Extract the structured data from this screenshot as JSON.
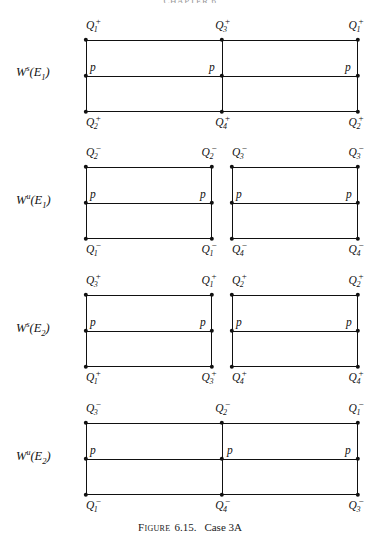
{
  "figure": {
    "caption_label": "Figure",
    "caption_number": "6.15.",
    "caption_title": "Case 3A",
    "header_remnant": "CHAPTER 6"
  },
  "rows": [
    {
      "name": "ws-e1",
      "label_w": "W",
      "label_sup": "s",
      "label_open": "(E",
      "label_sub": "1",
      "label_close": ")",
      "top_labels": [
        {
          "q": "Q",
          "sub": "1",
          "sup": "+"
        },
        {
          "q": "Q",
          "sub": "3",
          "sup": "+"
        },
        {
          "q": "Q",
          "sub": "1",
          "sup": "+"
        }
      ],
      "bottom_labels": [
        {
          "q": "Q",
          "sub": "2",
          "sup": "+"
        },
        {
          "q": "Q",
          "sub": "4",
          "sup": "+"
        },
        {
          "q": "Q",
          "sub": "2",
          "sup": "+"
        }
      ],
      "p_markers": [
        "p",
        "p",
        "p"
      ]
    },
    {
      "name": "wu-e1",
      "label_w": "W",
      "label_sup": "u",
      "label_open": "(E",
      "label_sub": "1",
      "label_close": ")",
      "left_box": {
        "top_left": {
          "q": "Q",
          "sub": "2",
          "sup": "−"
        },
        "top_right": {
          "q": "Q",
          "sub": "2",
          "sup": "−"
        },
        "bottom_left": {
          "q": "Q",
          "sub": "1",
          "sup": "−"
        },
        "bottom_right": {
          "q": "Q",
          "sub": "1",
          "sup": "−"
        },
        "p_left": "p",
        "p_right": "p"
      },
      "right_box": {
        "top_left": {
          "q": "Q",
          "sub": "3",
          "sup": "−"
        },
        "top_right": {
          "q": "Q",
          "sub": "3",
          "sup": "−"
        },
        "bottom_left": {
          "q": "Q",
          "sub": "4",
          "sup": "−"
        },
        "bottom_right": {
          "q": "Q",
          "sub": "4",
          "sup": "−"
        },
        "p_left": "p",
        "p_right": "p"
      }
    },
    {
      "name": "ws-e2",
      "label_w": "W",
      "label_sup": "s",
      "label_open": "(E",
      "label_sub": "2",
      "label_close": ")",
      "left_box": {
        "top_left": {
          "q": "Q",
          "sub": "3",
          "sup": "+"
        },
        "top_right": {
          "q": "Q",
          "sub": "1",
          "sup": "+"
        },
        "bottom_left": {
          "q": "Q",
          "sub": "1",
          "sup": "+"
        },
        "bottom_right": {
          "q": "Q",
          "sub": "3",
          "sup": "+"
        },
        "p_left": "p",
        "p_right": "p"
      },
      "right_box": {
        "top_left": {
          "q": "Q",
          "sub": "2",
          "sup": "+"
        },
        "top_right": {
          "q": "Q",
          "sub": "2",
          "sup": "+"
        },
        "bottom_left": {
          "q": "Q",
          "sub": "4",
          "sup": "+"
        },
        "bottom_right": {
          "q": "Q",
          "sub": "4",
          "sup": "+"
        },
        "p_left": "p",
        "p_right": "p"
      }
    },
    {
      "name": "wu-e2",
      "label_w": "W",
      "label_sup": "u",
      "label_open": "(E",
      "label_sub": "2",
      "label_close": ")",
      "top_labels": [
        {
          "q": "Q",
          "sub": "3",
          "sup": "−"
        },
        {
          "q": "Q",
          "sub": "2",
          "sup": "−"
        },
        {
          "q": "Q",
          "sub": "1",
          "sup": "−"
        }
      ],
      "bottom_labels": [
        {
          "q": "Q",
          "sub": "1",
          "sup": "−"
        },
        {
          "q": "Q",
          "sub": "4",
          "sup": "−"
        },
        {
          "q": "Q",
          "sub": "3",
          "sup": "−"
        }
      ],
      "p_markers": [
        "p",
        "p",
        "p"
      ]
    }
  ],
  "colors": {
    "ink": "#111111",
    "background": "#ffffff"
  }
}
